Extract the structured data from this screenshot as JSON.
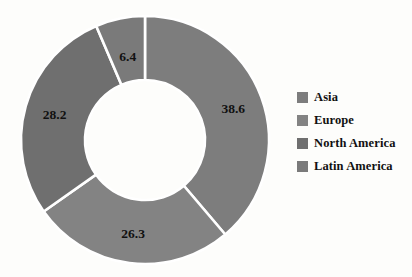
{
  "chart_data": {
    "type": "pie",
    "variant": "donut",
    "title": "",
    "subtitle": "",
    "xlabel": "",
    "ylabel": "",
    "grid": false,
    "legend_position": "right",
    "start_angle_deg": 0,
    "direction": "clockwise",
    "inner_radius_ratio": 0.48,
    "categories": [
      "Asia",
      "Europe",
      "North America",
      "Latin America"
    ],
    "values": [
      38.6,
      26.3,
      28.2,
      6.4
    ],
    "labels": [
      "38.6",
      "26.3",
      "28.2",
      "6.4"
    ],
    "colors": [
      "#7d7d7d",
      "#838383",
      "#6f6f6f",
      "#7a7a7a"
    ],
    "slice_separator_color": "#ffffff",
    "label_color": "#111111",
    "background": "#fdfdfb"
  },
  "legend": {
    "items": [
      {
        "label": "Asia",
        "color": "#7d7d7d"
      },
      {
        "label": "Europe",
        "color": "#838383"
      },
      {
        "label": "North America",
        "color": "#6f6f6f"
      },
      {
        "label": "Latin America",
        "color": "#7a7a7a"
      }
    ]
  },
  "geometry": {
    "cx": 145,
    "cy": 140,
    "outer_r": 124,
    "inner_r": 60
  }
}
